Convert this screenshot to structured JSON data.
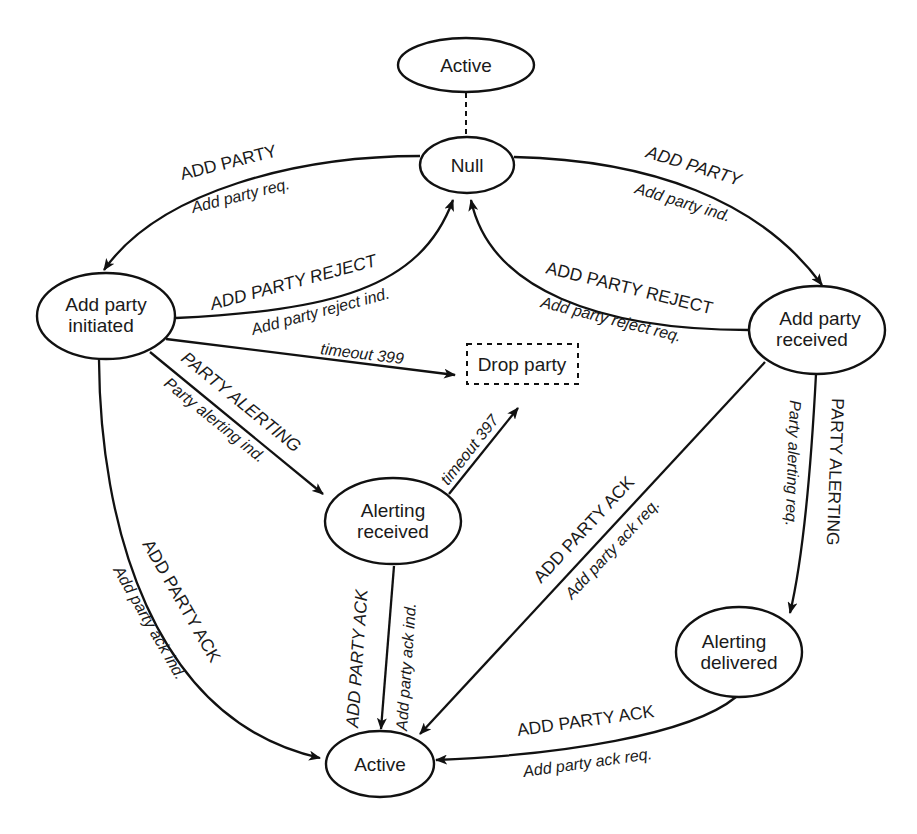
{
  "diagram": {
    "nodes": {
      "active_top": {
        "label": "Active",
        "style": "solid"
      },
      "null": {
        "label": "Null",
        "style": "solid"
      },
      "add_party_initiated": {
        "line1": "Add party",
        "line2": "initiated",
        "style": "solid"
      },
      "add_party_received": {
        "line1": "Add party",
        "line2": "received",
        "style": "solid"
      },
      "drop_party": {
        "label": "Drop party",
        "style": "dashed"
      },
      "alerting_received": {
        "line1": "Alerting",
        "line2": "received",
        "style": "solid"
      },
      "alerting_delivered": {
        "line1": "Alerting",
        "line2": "delivered",
        "style": "solid"
      },
      "active_bottom": {
        "label": "Active",
        "style": "solid"
      }
    },
    "edges": {
      "active_null": {
        "from": "Active",
        "to": "Null",
        "style": "dashed",
        "signal": "",
        "primitive": ""
      },
      "null_to_initiated": {
        "from": "Null",
        "to": "Add party initiated",
        "signal": "ADD PARTY",
        "primitive": "Add party req."
      },
      "null_to_received": {
        "from": "Null",
        "to": "Add party received",
        "signal": "ADD PARTY",
        "primitive": "Add party ind."
      },
      "initiated_to_null": {
        "from": "Add party initiated",
        "to": "Null",
        "signal": "ADD PARTY REJECT",
        "primitive": "Add party reject ind."
      },
      "received_to_null": {
        "from": "Add party received",
        "to": "Null",
        "signal": "ADD PARTY REJECT",
        "primitive": "Add party reject req."
      },
      "initiated_to_drop": {
        "from": "Add party initiated",
        "to": "Drop party",
        "signal": "timeout 399",
        "primitive": ""
      },
      "alerting_received_to_drop": {
        "from": "Alerting received",
        "to": "Drop party",
        "signal": "timeout 397",
        "primitive": ""
      },
      "initiated_to_alerting_received": {
        "from": "Add party initiated",
        "to": "Alerting received",
        "signal": "PARTY ALERTING",
        "primitive": "Party alerting ind."
      },
      "received_to_alerting_delivered": {
        "from": "Add party received",
        "to": "Alerting delivered",
        "signal": "PARTY ALERTING",
        "primitive": "Party alerting req."
      },
      "initiated_to_active": {
        "from": "Add party initiated",
        "to": "Active",
        "signal": "ADD PARTY ACK",
        "primitive": "Add party ack ind."
      },
      "alerting_received_to_active": {
        "from": "Alerting received",
        "to": "Active",
        "signal": "ADD PARTY ACK",
        "primitive": "Add party ack ind."
      },
      "received_to_active": {
        "from": "Add party received",
        "to": "Active",
        "signal": "ADD PARTY ACK",
        "primitive": "Add party ack req."
      },
      "alerting_delivered_to_active": {
        "from": "Alerting delivered",
        "to": "Active",
        "signal": "ADD PARTY ACK",
        "primitive": "Add party ack req."
      }
    }
  }
}
